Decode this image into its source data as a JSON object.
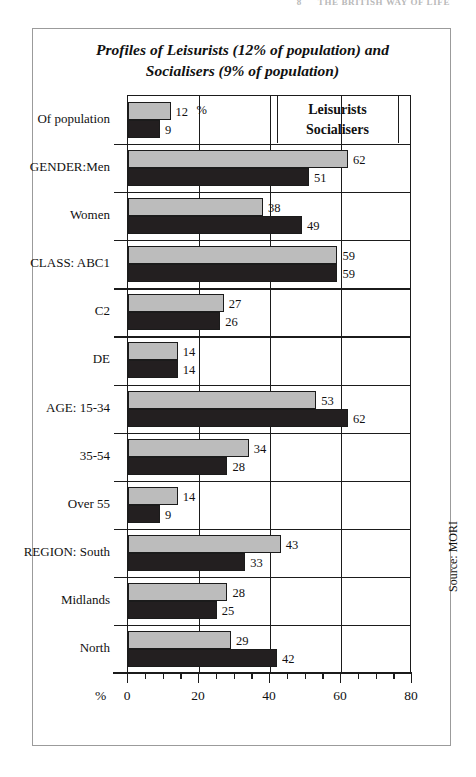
{
  "running_head": {
    "page": "8",
    "text": "THE BRITISH WAY OF LIFE"
  },
  "figure": {
    "title_line1": "Profiles of Leisurists (12% of population) and",
    "title_line2": "Socialisers  (9% of population)",
    "source": "Source: MORI"
  },
  "legend": {
    "series1": "Leisurists",
    "series2": "Socialisers"
  },
  "axis": {
    "unit_symbol": "%",
    "first_row_unit": "%",
    "tick_labels": [
      "0",
      "20",
      "40",
      "60",
      "80"
    ]
  },
  "colors": {
    "leisurists": "#bcbcbc",
    "socialisers": "#231f20",
    "axis": "#1b1b1b",
    "frame": "#9b9b9b"
  },
  "chart_data": {
    "type": "bar",
    "orientation": "horizontal",
    "title": "Profiles of Leisurists (12% of population) and Socialisers  (9% of population)",
    "xlabel": "%",
    "ylabel": "",
    "xlim": [
      0,
      80
    ],
    "xticks": [
      0,
      20,
      40,
      60,
      80
    ],
    "minor_tick_step": 5,
    "grid": "vertical major gridlines at 20, 40, 60",
    "legend_position": "inside top-right",
    "annotation": "Source: MORI",
    "categories": [
      "Of population",
      "GENDER:Men",
      "Women",
      "CLASS: ABC1",
      "C2",
      "DE",
      "AGE: 15-34",
      "35-54",
      "Over 55",
      "REGION: South",
      "Midlands",
      "North"
    ],
    "series": [
      {
        "name": "Leisurists",
        "values": [
          12,
          62,
          38,
          59,
          27,
          14,
          53,
          34,
          14,
          43,
          28,
          29
        ]
      },
      {
        "name": "Socialisers",
        "values": [
          9,
          51,
          49,
          59,
          26,
          14,
          62,
          28,
          9,
          33,
          25,
          42
        ]
      }
    ]
  }
}
